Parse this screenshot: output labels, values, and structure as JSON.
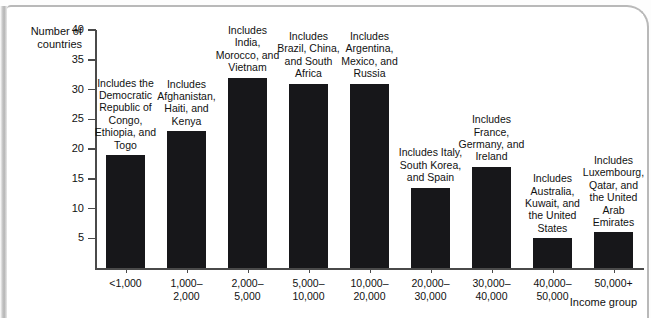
{
  "chart_data": {
    "type": "bar",
    "title": "",
    "subtitle": "",
    "xlabel": "Income group",
    "ylabel": "Number of countries",
    "ylim": [
      0,
      40
    ],
    "yticks": [
      5,
      10,
      15,
      20,
      25,
      30,
      35,
      40
    ],
    "grid": false,
    "legend": false,
    "bar_color": "#17171a",
    "axis_color": "#4a4a4a",
    "categories": [
      "<1,000",
      "1,000–\n2,000",
      "2,000–\n5,000",
      "5,000–\n10,000",
      "10,000–\n20,000",
      "20,000–\n30,000",
      "30,000–\n40,000",
      "40,000–\n50,000",
      "50,000+"
    ],
    "values": [
      19,
      23,
      32,
      31,
      31,
      13.5,
      17,
      5,
      6
    ],
    "annotations": [
      "Includes the Democratic Republic of Congo, Ethiopia, and Togo",
      "Includes Afghanistan, Haiti, and Kenya",
      "Includes India, Morocco, and Vietnam",
      "Includes Brazil, China, and South Africa",
      "Includes Argentina, Mexico, and Russia",
      "Includes Italy, South Korea, and Spain",
      "Includes France, Germany, and Ireland",
      "Includes Australia, Kuwait, and the United States",
      "Includes Luxembourg, Qatar, and the United Arab Emirates"
    ]
  },
  "axes": {
    "y_label_line1": "Number of",
    "y_label_line2": "countries",
    "x_label": "Income group"
  },
  "bars": [
    {
      "cat_line1": "<1,000",
      "cat_line2": "",
      "value": 19,
      "note": "Includes the Democratic Republic of Congo, Ethiopia, and Togo"
    },
    {
      "cat_line1": "1,000–",
      "cat_line2": "2,000",
      "value": 23,
      "note": "Includes Afghanistan, Haiti, and Kenya"
    },
    {
      "cat_line1": "2,000–",
      "cat_line2": "5,000",
      "value": 32,
      "note": "Includes India, Morocco, and Vietnam"
    },
    {
      "cat_line1": "5,000–",
      "cat_line2": "10,000",
      "value": 31,
      "note": "Includes Brazil, China, and South Africa"
    },
    {
      "cat_line1": "10,000–",
      "cat_line2": "20,000",
      "value": 31,
      "note": "Includes Argentina, Mexico, and Russia"
    },
    {
      "cat_line1": "20,000–",
      "cat_line2": "30,000",
      "value": 13.5,
      "note": "Includes Italy, South Korea, and Spain"
    },
    {
      "cat_line1": "30,000–",
      "cat_line2": "40,000",
      "value": 17,
      "note": "Includes France, Germany, and Ireland"
    },
    {
      "cat_line1": "40,000–",
      "cat_line2": "50,000",
      "value": 5,
      "note": "Includes Australia, Kuwait, and the United States"
    },
    {
      "cat_line1": "50,000+",
      "cat_line2": "",
      "value": 6,
      "note": "Includes Luxembourg, Qatar, and the United Arab Emirates"
    }
  ],
  "yticks": [
    {
      "label": "40",
      "value": 40
    },
    {
      "label": "35",
      "value": 35
    },
    {
      "label": "30",
      "value": 30
    },
    {
      "label": "25",
      "value": 25
    },
    {
      "label": "20",
      "value": 20
    },
    {
      "label": "15",
      "value": 15
    },
    {
      "label": "10",
      "value": 10
    },
    {
      "label": "5",
      "value": 5
    }
  ]
}
